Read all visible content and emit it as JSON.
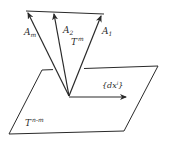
{
  "diagram": {
    "colors": {
      "stroke": "#2a2a2a",
      "background": "#ffffff"
    },
    "labels": {
      "a_m": {
        "base": "A",
        "sub": "m"
      },
      "a_2": {
        "base": "A",
        "sub": "2"
      },
      "a_1": {
        "base": "A",
        "sub": "1"
      },
      "t_m": {
        "base": "T",
        "sup": "m"
      },
      "dx": {
        "text": "{dx",
        "sup": "i",
        "close": "}"
      },
      "t_nm": {
        "base": "T",
        "sup": "n-m"
      }
    }
  }
}
